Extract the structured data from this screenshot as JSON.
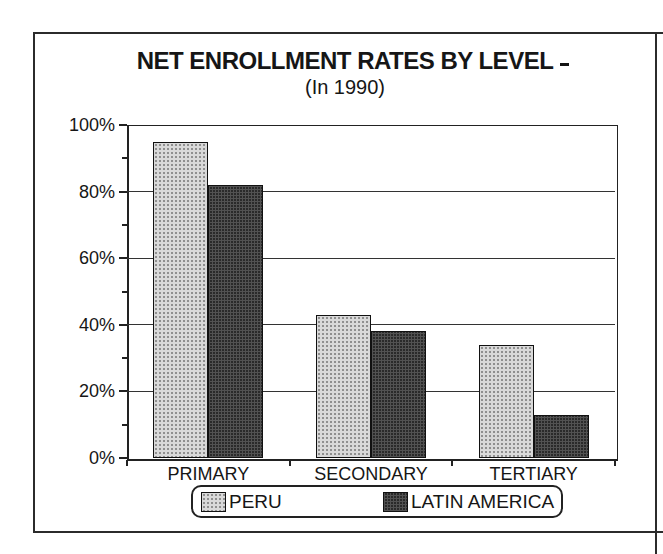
{
  "chart": {
    "title": "NET ENROLLMENT RATES BY LEVEL",
    "subtitle": "(In 1990)"
  },
  "chart_data": {
    "type": "bar",
    "title": "NET ENROLLMENT RATES BY LEVEL",
    "subtitle": "(In 1990)",
    "categories": [
      "PRIMARY",
      "SECONDARY",
      "TERTIARY"
    ],
    "series": [
      {
        "name": "PERU",
        "values": [
          95,
          43,
          34
        ],
        "fill": "#d9d9d9",
        "pattern": "dot-stipple"
      },
      {
        "name": "LATIN AMERICA",
        "values": [
          82,
          38,
          13
        ],
        "fill": "#2a2a2a",
        "pattern": "crosshatch"
      }
    ],
    "value_unit": "%",
    "xlabel": "",
    "ylabel": "",
    "ylim": [
      0,
      100
    ],
    "yticks": [
      0,
      20,
      40,
      60,
      80,
      100
    ],
    "ytick_labels": [
      "0%",
      "20%",
      "40%",
      "60%",
      "80%",
      "100%"
    ],
    "minor_yticks": [
      10,
      30,
      50,
      70,
      90
    ],
    "grid": "horizontal",
    "legend_position": "bottom"
  }
}
